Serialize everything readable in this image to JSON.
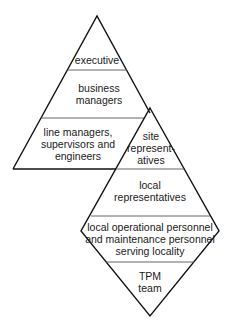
{
  "diagram": {
    "type": "two-linked-hierarchy-shapes",
    "colors": {
      "line": "#111111",
      "separator": "#555555",
      "text": "#1a1a1a",
      "background": "#ffffff"
    },
    "pyramid": {
      "shape": "triangle",
      "levels": [
        {
          "id": "executive",
          "lines": [
            "executive"
          ]
        },
        {
          "id": "business-managers",
          "lines": [
            "business",
            "managers"
          ]
        },
        {
          "id": "line-managers",
          "lines": [
            "line managers,",
            "supervisors and",
            "engineers"
          ]
        }
      ]
    },
    "diamond": {
      "shape": "diamond",
      "levels": [
        {
          "id": "site-representatives",
          "lines": [
            "site",
            "represent-",
            "atives"
          ]
        },
        {
          "id": "local-representatives",
          "lines": [
            "local",
            "representatives"
          ]
        },
        {
          "id": "local-operational",
          "lines": [
            "local operational personnel",
            "and maintenance personnel",
            "serving locality"
          ]
        },
        {
          "id": "tpm-team",
          "lines": [
            "TPM",
            "team"
          ]
        }
      ]
    }
  }
}
